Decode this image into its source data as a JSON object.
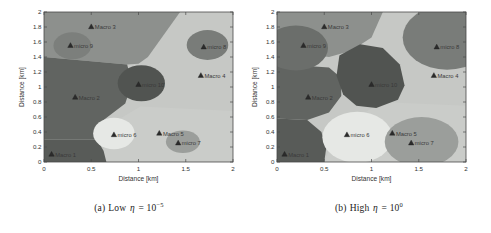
{
  "captions": {
    "a": {
      "index": "(a)",
      "label": "Low",
      "symbol": "η",
      "equals": " = ",
      "base": "10",
      "exponent": "−5"
    },
    "b": {
      "index": "(b)",
      "label": "High",
      "symbol": "η",
      "equals": " = ",
      "base": "10",
      "exponent": "0"
    }
  },
  "palette": {
    "axis": "#4a4a4a",
    "tick_text": "#333333",
    "station_marker": "#2b2b2b",
    "station_text": "#3a3a3a",
    "base_light": "#c6c8c5"
  },
  "chart_data": [
    {
      "type": "heatmap",
      "id": "a",
      "title": "",
      "xlabel": "Distance [km]",
      "ylabel": "Distance [km]",
      "xlim": [
        0,
        2
      ],
      "ylim": [
        0,
        2
      ],
      "grid": false,
      "xtick_values": [
        0,
        0.5,
        1,
        1.5,
        2
      ],
      "xtick_labels": [
        "0",
        "0.5",
        "1",
        "1.5",
        "2"
      ],
      "ytick_values": [
        0,
        0.2,
        0.4,
        0.6,
        0.8,
        1,
        1.2,
        1.4,
        1.6,
        1.8,
        2
      ],
      "ytick_labels": [
        "0",
        "0.2",
        "0.4",
        "0.6",
        "0.8",
        "1",
        "1.2",
        "1.4",
        "1.6",
        "1.8",
        "2"
      ],
      "base_color": "#c6c8c5",
      "regions": [
        {
          "name": "macro-5-cell",
          "shape": "polygon",
          "color": "#caccc9",
          "points": [
            [
              0.6,
              0
            ],
            [
              2,
              0
            ],
            [
              2,
              0.68
            ],
            [
              1.02,
              0.74
            ],
            [
              0.7,
              0.5
            ],
            [
              0.64,
              0.22
            ]
          ]
        },
        {
          "name": "macro-3-cell",
          "shape": "polygon",
          "color": "#8d908d",
          "points": [
            [
              0,
              2
            ],
            [
              1.44,
              2
            ],
            [
              1.1,
              1.4
            ],
            [
              1.0,
              1.31
            ],
            [
              0.88,
              1.3
            ],
            [
              0,
              1.4
            ]
          ]
        },
        {
          "name": "macro-2-cell",
          "shape": "polygon",
          "color": "#616461",
          "points": [
            [
              0,
              1.4
            ],
            [
              0.88,
              1.3
            ],
            [
              0.93,
              1.05
            ],
            [
              0.86,
              0.78
            ],
            [
              0.62,
              0.55
            ],
            [
              0.56,
              0.3
            ],
            [
              0,
              0.3
            ]
          ]
        },
        {
          "name": "macro-1-cell",
          "shape": "polygon",
          "color": "#585b58",
          "points": [
            [
              0,
              0.3
            ],
            [
              0.56,
              0.3
            ],
            [
              0.63,
              0.15
            ],
            [
              0.66,
              0
            ],
            [
              0,
              0
            ]
          ]
        },
        {
          "name": "micro-9-cell",
          "shape": "ellipse",
          "color": "#7c7f7c",
          "cx": 0.3,
          "cy": 1.55,
          "rx": 0.2,
          "ry": 0.18
        },
        {
          "name": "micro-10-cell",
          "shape": "ellipse",
          "color": "#515451",
          "cx": 1.03,
          "cy": 1.05,
          "rx": 0.25,
          "ry": 0.24
        },
        {
          "name": "micro-8-cell",
          "shape": "ellipse",
          "color": "#797c79",
          "cx": 1.73,
          "cy": 1.56,
          "rx": 0.22,
          "ry": 0.2
        },
        {
          "name": "micro-6-cell",
          "shape": "ellipse",
          "color": "#e6e8e5",
          "cx": 0.74,
          "cy": 0.38,
          "rx": 0.22,
          "ry": 0.21
        },
        {
          "name": "micro-7-cell",
          "shape": "ellipse",
          "color": "#9b9e9b",
          "cx": 1.47,
          "cy": 0.27,
          "rx": 0.18,
          "ry": 0.15
        }
      ],
      "stations": [
        {
          "label": "Macro 1",
          "x": 0.08,
          "y": 0.1
        },
        {
          "label": "Macro 2",
          "x": 0.33,
          "y": 0.86
        },
        {
          "label": "Macro 3",
          "x": 0.5,
          "y": 1.8
        },
        {
          "label": "Macro 4",
          "x": 1.66,
          "y": 1.15
        },
        {
          "label": "Macro 5",
          "x": 1.22,
          "y": 0.38
        },
        {
          "label": "micro 6",
          "x": 0.74,
          "y": 0.36
        },
        {
          "label": "micro 7",
          "x": 1.42,
          "y": 0.25
        },
        {
          "label": "micro 8",
          "x": 1.69,
          "y": 1.53
        },
        {
          "label": "micro 9",
          "x": 0.28,
          "y": 1.55
        },
        {
          "label": "micro 10",
          "x": 1.0,
          "y": 1.03
        }
      ]
    },
    {
      "type": "heatmap",
      "id": "b",
      "title": "",
      "xlabel": "Distance [km]",
      "ylabel": "Distance [km]",
      "xlim": [
        0,
        2
      ],
      "ylim": [
        0,
        2
      ],
      "grid": false,
      "xtick_values": [
        0,
        0.5,
        1,
        1.5,
        2
      ],
      "xtick_labels": [
        "0",
        "0.5",
        "1",
        "1.5",
        "2"
      ],
      "ytick_values": [
        0,
        0.2,
        0.4,
        0.6,
        0.8,
        1,
        1.2,
        1.4,
        1.6,
        1.8,
        2
      ],
      "ytick_labels": [
        "0",
        "0.2",
        "0.4",
        "0.6",
        "0.8",
        "1",
        "1.2",
        "1.4",
        "1.6",
        "1.8",
        "2"
      ],
      "base_color": "#c6c8c5",
      "regions": [
        {
          "name": "macro-5-cell",
          "shape": "polygon",
          "color": "#caccc9",
          "points": [
            [
              0.5,
              0
            ],
            [
              2,
              0
            ],
            [
              2,
              0.75
            ],
            [
              1.1,
              0.8
            ],
            [
              0.8,
              0.55
            ],
            [
              0.6,
              0.3
            ]
          ]
        },
        {
          "name": "macro-3-cell",
          "shape": "polygon",
          "color": "#8d908d",
          "points": [
            [
              0,
              2
            ],
            [
              1.12,
              2
            ],
            [
              1.0,
              1.66
            ],
            [
              0.78,
              1.48
            ],
            [
              0.55,
              1.4
            ],
            [
              0.32,
              1.44
            ],
            [
              0.12,
              1.6
            ],
            [
              0,
              1.76
            ]
          ]
        },
        {
          "name": "macro-2-cell",
          "shape": "polygon",
          "color": "#616461",
          "points": [
            [
              0,
              1.35
            ],
            [
              0.32,
              1.28
            ],
            [
              0.55,
              1.26
            ],
            [
              0.68,
              1.12
            ],
            [
              0.68,
              0.88
            ],
            [
              0.55,
              0.66
            ],
            [
              0.32,
              0.56
            ],
            [
              0,
              0.58
            ]
          ]
        },
        {
          "name": "macro-1-cell",
          "shape": "polygon",
          "color": "#585b58",
          "points": [
            [
              0,
              0.58
            ],
            [
              0.32,
              0.56
            ],
            [
              0.47,
              0.4
            ],
            [
              0.52,
              0.18
            ],
            [
              0.5,
              0
            ],
            [
              0,
              0
            ]
          ]
        },
        {
          "name": "micro-9-cell",
          "shape": "ellipse",
          "color": "#6b6e6b",
          "cx": 0.2,
          "cy": 1.52,
          "rx": 0.34,
          "ry": 0.3
        },
        {
          "name": "micro-10-cell",
          "shape": "polygon",
          "color": "#515451",
          "points": [
            [
              0.66,
              1.42
            ],
            [
              0.88,
              1.57
            ],
            [
              1.12,
              1.52
            ],
            [
              1.3,
              1.3
            ],
            [
              1.35,
              1.02
            ],
            [
              1.28,
              0.83
            ],
            [
              1.05,
              0.72
            ],
            [
              0.84,
              0.75
            ],
            [
              0.7,
              0.9
            ],
            [
              0.63,
              1.15
            ]
          ]
        },
        {
          "name": "micro-8-cell",
          "shape": "ellipse",
          "color": "#797c79",
          "cx": 1.8,
          "cy": 1.66,
          "rx": 0.47,
          "ry": 0.43
        },
        {
          "name": "micro-6-cell",
          "shape": "ellipse",
          "color": "#e6e8e5",
          "cx": 0.85,
          "cy": 0.33,
          "rx": 0.37,
          "ry": 0.34
        },
        {
          "name": "micro-7-cell",
          "shape": "ellipse",
          "color": "#9b9e9b",
          "cx": 1.53,
          "cy": 0.27,
          "rx": 0.39,
          "ry": 0.33
        }
      ],
      "stations": [
        {
          "label": "Macro 1",
          "x": 0.08,
          "y": 0.1
        },
        {
          "label": "Macro 2",
          "x": 0.33,
          "y": 0.86
        },
        {
          "label": "Macro 3",
          "x": 0.5,
          "y": 1.8
        },
        {
          "label": "Macro 4",
          "x": 1.66,
          "y": 1.15
        },
        {
          "label": "Macro 5",
          "x": 1.22,
          "y": 0.38
        },
        {
          "label": "micro 6",
          "x": 0.74,
          "y": 0.36
        },
        {
          "label": "micro 7",
          "x": 1.42,
          "y": 0.25
        },
        {
          "label": "micro 8",
          "x": 1.69,
          "y": 1.53
        },
        {
          "label": "micro 9",
          "x": 0.28,
          "y": 1.55
        },
        {
          "label": "micro 10",
          "x": 1.0,
          "y": 1.03
        }
      ]
    }
  ]
}
